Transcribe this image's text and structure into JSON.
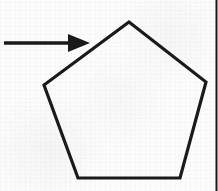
{
  "figure": {
    "width": 218,
    "height": 191,
    "background_color": "#fcfcfc",
    "ink_color": "#1a1a1a",
    "border_color": "#3a3a3a"
  },
  "shapes": {
    "pentagon": {
      "name": "pentagon",
      "sides": 5,
      "stroke_width": 3.2,
      "fill": "none",
      "vertices": [
        {
          "label": "apex",
          "x": 129,
          "y": 22
        },
        {
          "label": "upper-right",
          "x": 206,
          "y": 82
        },
        {
          "label": "lower-right",
          "x": 180,
          "y": 178
        },
        {
          "label": "lower-left",
          "x": 78,
          "y": 178
        },
        {
          "label": "upper-left",
          "x": 44,
          "y": 85
        }
      ],
      "points_attr": "129,22 206,82 180,178 78,178 44,85"
    },
    "arrow": {
      "name": "arrow",
      "direction": "right",
      "shaft_stroke_width": 3.4,
      "shaft_start_x": 4,
      "shaft_end_x": 70,
      "shaft_y": 43,
      "head_points_attr": "68,34 90,43 68,52",
      "points_to": "upper-left edge of pentagon"
    },
    "right_border": {
      "name": "page-edge-rule",
      "x": 216.5,
      "y_start": 0,
      "y_end": 191,
      "stroke_width": 2
    }
  }
}
